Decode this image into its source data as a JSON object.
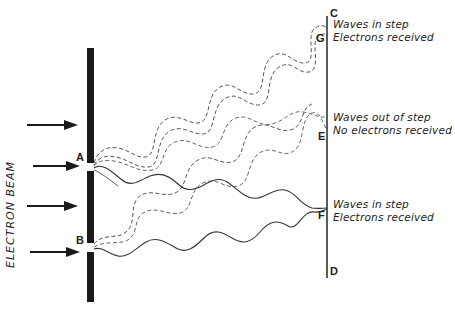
{
  "diagram": {
    "type": "double-slit electron interference",
    "beam_label": "ELECTRON  BEAM",
    "slits": {
      "a": "A",
      "b": "B"
    },
    "screen_points": {
      "c": "C",
      "g": "G",
      "e": "E",
      "f": "F",
      "d": "D"
    },
    "annotations": {
      "g": {
        "line1": "Waves in step",
        "line2": "Electrons received"
      },
      "e": {
        "line1": "Waves out of step",
        "line2": "No electrons received"
      },
      "f": {
        "line1": "Waves in step",
        "line2": "Electrons received"
      }
    },
    "arrows_count": 4,
    "colors": {
      "ink": "#222222",
      "barrier": "#1a1a1a",
      "background": "#ffffff"
    }
  }
}
